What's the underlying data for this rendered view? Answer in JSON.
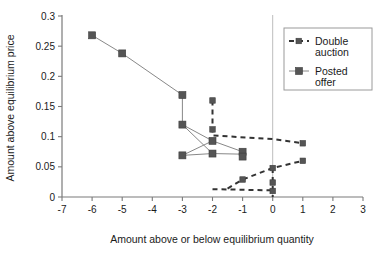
{
  "chart_data": {
    "type": "line",
    "title": "",
    "xlabel": "Amount above or below equilibrium quantity",
    "ylabel": "Amount above equilibrium price",
    "xlim": [
      -7,
      3
    ],
    "ylim": [
      0,
      0.3
    ],
    "xticks": [
      -7,
      -6,
      -5,
      -4,
      -3,
      -2,
      -1,
      0,
      1,
      2,
      3
    ],
    "xtick_labels": [
      "-7",
      "-6",
      "-5",
      "-4",
      "-3",
      "-2",
      "-1",
      "0",
      "1",
      "2",
      "3"
    ],
    "yticks": [
      0,
      0.05,
      0.1,
      0.15,
      0.2,
      0.25,
      0.3
    ],
    "ytick_labels": [
      "0",
      "0.05",
      "0.1",
      "0.15",
      "0.2",
      "0.25",
      "0.3"
    ],
    "grid": false,
    "legend_position": "top-right",
    "marker_color": "#555555",
    "line_color": "#888888",
    "dash_color": "#333333",
    "series": [
      {
        "name": "Double auction",
        "style": "dashed",
        "marker": "square-small",
        "paths": [
          {
            "name": "upper-branch",
            "points": [
              {
                "x": -2,
                "y": 0.16
              },
              {
                "x": -2,
                "y": 0.138
              },
              {
                "x": -2,
                "y": 0.112
              },
              {
                "x": -2,
                "y": 0.102
              },
              {
                "x": 0,
                "y": 0.096
              },
              {
                "x": 1,
                "y": 0.089
              }
            ]
          },
          {
            "name": "lower-rising-branch",
            "points": [
              {
                "x": -1.5,
                "y": 0.014
              },
              {
                "x": -1,
                "y": 0.029
              },
              {
                "x": 0,
                "y": 0.048
              },
              {
                "x": 1,
                "y": 0.06
              }
            ]
          },
          {
            "name": "flat-bottom-branch",
            "points": [
              {
                "x": -2,
                "y": 0.013
              },
              {
                "x": -1,
                "y": 0.012
              },
              {
                "x": 0,
                "y": 0.011
              }
            ]
          },
          {
            "name": "zero-stack",
            "points": [
              {
                "x": 0,
                "y": 0.048
              },
              {
                "x": 0,
                "y": 0.03
              },
              {
                "x": 0,
                "y": 0.018
              },
              {
                "x": 0,
                "y": 0.006
              },
              {
                "x": 0,
                "y": 0.0
              }
            ]
          }
        ],
        "markers": [
          {
            "x": -2,
            "y": 0.16
          },
          {
            "x": -2,
            "y": 0.112
          },
          {
            "x": -1,
            "y": 0.029
          },
          {
            "x": 0,
            "y": 0.048
          },
          {
            "x": 0,
            "y": 0.024
          },
          {
            "x": 0,
            "y": 0.01
          },
          {
            "x": 1,
            "y": 0.089
          },
          {
            "x": 1,
            "y": 0.06
          }
        ]
      },
      {
        "name": "Posted offer",
        "style": "solid",
        "marker": "square",
        "paths": [
          {
            "name": "main-descending",
            "points": [
              {
                "x": -6,
                "y": 0.268
              },
              {
                "x": -5,
                "y": 0.238
              },
              {
                "x": -3,
                "y": 0.169
              },
              {
                "x": -3,
                "y": 0.12
              },
              {
                "x": -2,
                "y": 0.093
              },
              {
                "x": -1,
                "y": 0.075
              }
            ]
          },
          {
            "name": "lower-fan",
            "points": [
              {
                "x": -3,
                "y": 0.069
              },
              {
                "x": -2,
                "y": 0.072
              },
              {
                "x": -1,
                "y": 0.071
              }
            ]
          },
          {
            "name": "fan-cross",
            "points": [
              {
                "x": -3,
                "y": 0.12
              },
              {
                "x": -2,
                "y": 0.072
              }
            ]
          },
          {
            "name": "fan-cross-2",
            "points": [
              {
                "x": -3,
                "y": 0.069
              },
              {
                "x": -2,
                "y": 0.093
              }
            ]
          }
        ],
        "markers": [
          {
            "x": -6,
            "y": 0.268
          },
          {
            "x": -5,
            "y": 0.238
          },
          {
            "x": -3,
            "y": 0.169
          },
          {
            "x": -3,
            "y": 0.12
          },
          {
            "x": -3,
            "y": 0.069
          },
          {
            "x": -2,
            "y": 0.093
          },
          {
            "x": -2,
            "y": 0.072
          },
          {
            "x": -1,
            "y": 0.075
          },
          {
            "x": -1,
            "y": 0.067
          }
        ]
      }
    ],
    "legend": [
      {
        "label_line1": "Double",
        "label_line2": "auction",
        "style": "dashed"
      },
      {
        "label_line1": "Posted",
        "label_line2": "offer",
        "style": "solid"
      }
    ]
  }
}
